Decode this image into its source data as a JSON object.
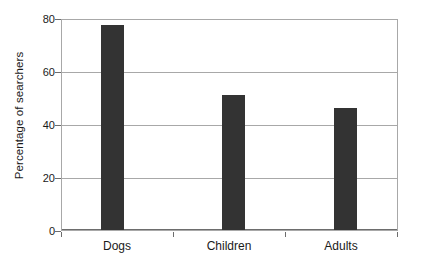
{
  "chart_data": {
    "type": "bar",
    "title": "",
    "xlabel": "",
    "ylabel": "Percentage of searchers",
    "categories": [
      "Dogs",
      "Children",
      "Adults"
    ],
    "values": [
      77.5,
      51,
      46
    ],
    "ylim": [
      0,
      80
    ],
    "yticks": [
      0,
      20,
      40,
      60,
      80
    ],
    "ytick_labels": [
      "0",
      "20",
      "40",
      "60",
      "80"
    ],
    "grid": true,
    "legend": null,
    "bar_color": "#333333",
    "axis_color": "#6d6d6d",
    "grid_color": "#a8a8a8",
    "background_color": "#ffffff"
  },
  "axis": {
    "y_title": "Percentage of searchers",
    "y_tick_0": "0",
    "y_tick_20": "20",
    "y_tick_40": "40",
    "y_tick_60": "60",
    "y_tick_80": "80"
  },
  "bars": [
    {
      "label": "Dogs",
      "value": 77.5
    },
    {
      "label": "Children",
      "value": 51
    },
    {
      "label": "Adults",
      "value": 46
    }
  ]
}
